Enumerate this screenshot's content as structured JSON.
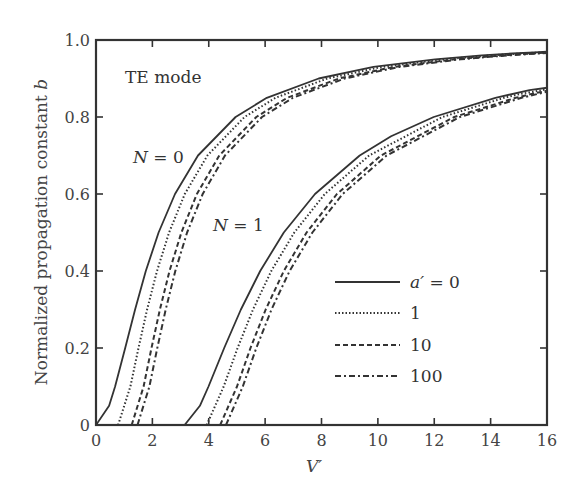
{
  "chart_data": {
    "type": "line",
    "title": "",
    "xlabel": "V′",
    "ylabel": "Normalized propagation constant b",
    "ylabel_plain": "Normalized propagation constant ",
    "ylabel_var": "b",
    "xlim": [
      0,
      16
    ],
    "ylim": [
      0,
      1.0
    ],
    "xticks": [
      0,
      2,
      4,
      6,
      8,
      10,
      12,
      14,
      16
    ],
    "xtick_labels": [
      "0",
      "2",
      "4",
      "6",
      "8",
      "10",
      "12",
      "14",
      "16"
    ],
    "yticks": [
      0,
      0.2,
      0.4,
      0.6,
      0.8,
      1.0
    ],
    "ytick_labels": [
      "0",
      "0.2",
      "0.4",
      "0.6",
      "0.8",
      "1.0"
    ],
    "grid": false,
    "legend_position": "lower right (inside)",
    "annotations": [
      {
        "text": "TE mode",
        "x": 0.5,
        "y": 0.92
      },
      {
        "text": "N = 0",
        "x": 1.5,
        "y": 0.69
      },
      {
        "text": "N = 1",
        "x": 4.3,
        "y": 0.52
      }
    ],
    "legend": [
      {
        "label": "a′ = 0",
        "style": "solid"
      },
      {
        "label": "1",
        "style": "dotted"
      },
      {
        "label": "10",
        "style": "dashed"
      },
      {
        "label": "100",
        "style": "dashdot"
      }
    ],
    "series": [
      {
        "name": "N=0, a'=0",
        "mode": 0,
        "a": 0,
        "style": "solid",
        "V": [
          0,
          0.463,
          0.678,
          1.037,
          1.386,
          1.768,
          2.221,
          2.802,
          3.619,
          4.951,
          6.058,
          7.899,
          9.846,
          12.03,
          13.69,
          14.77,
          15.55,
          16.13
        ],
        "b": [
          0,
          0.05,
          0.1,
          0.2,
          0.3,
          0.4,
          0.5,
          0.6,
          0.7,
          0.8,
          0.85,
          0.9,
          0.93,
          0.95,
          0.96,
          0.965,
          0.968,
          0.97
        ]
      },
      {
        "name": "N=0, a'=1",
        "mode": 0,
        "a": 1,
        "style": "dotted",
        "V": [
          0.785,
          1.22,
          1.509,
          1.814,
          2.164,
          2.592,
          3.151,
          3.952,
          5.268,
          6.368,
          8.204,
          10.15,
          12.33,
          13.99,
          15.07,
          15.58,
          16.2
        ],
        "b": [
          0,
          0.1,
          0.2,
          0.3,
          0.4,
          0.5,
          0.6,
          0.7,
          0.8,
          0.85,
          0.9,
          0.93,
          0.95,
          0.96,
          0.965,
          0.967,
          0.969
        ]
      },
      {
        "name": "N=0, a'=10",
        "mode": 0,
        "a": 10,
        "style": "dashed",
        "V": [
          1.265,
          1.69,
          1.969,
          2.266,
          2.607,
          3.028,
          3.581,
          4.375,
          5.686,
          6.783,
          8.615,
          10.56,
          12.74,
          14.4,
          15.48,
          16.2
        ],
        "b": [
          0,
          0.1,
          0.2,
          0.3,
          0.4,
          0.5,
          0.6,
          0.7,
          0.8,
          0.85,
          0.9,
          0.93,
          0.95,
          0.96,
          0.965,
          0.968
        ]
      },
      {
        "name": "N=0, a'=100",
        "mode": 0,
        "a": 100,
        "style": "dashdot",
        "V": [
          1.471,
          1.895,
          2.175,
          2.471,
          2.812,
          3.233,
          3.785,
          4.578,
          5.889,
          6.985,
          8.818,
          10.76,
          12.94,
          14.6,
          15.68,
          16.2
        ],
        "b": [
          0,
          0.1,
          0.2,
          0.3,
          0.4,
          0.5,
          0.6,
          0.7,
          0.8,
          0.85,
          0.9,
          0.93,
          0.95,
          0.96,
          0.965,
          0.967
        ]
      },
      {
        "name": "N=1, a'=0",
        "mode": 1,
        "a": 0,
        "style": "solid",
        "V": [
          3.142,
          3.686,
          3.99,
          4.549,
          5.14,
          5.824,
          6.664,
          7.769,
          9.355,
          10.47,
          11.98,
          14.17,
          15.38,
          16.2
        ],
        "b": [
          0,
          0.05,
          0.1,
          0.2,
          0.3,
          0.4,
          0.5,
          0.6,
          0.7,
          0.75,
          0.8,
          0.85,
          0.87,
          0.878
        ]
      },
      {
        "name": "N=1, a'=1",
        "mode": 1,
        "a": 1,
        "style": "dotted",
        "V": [
          3.927,
          4.531,
          5.022,
          5.569,
          6.219,
          7.035,
          8.118,
          9.688,
          12.29,
          14.48,
          15.05,
          16.2
        ],
        "b": [
          0,
          0.1,
          0.2,
          0.3,
          0.4,
          0.5,
          0.6,
          0.7,
          0.8,
          0.85,
          0.86,
          0.874
        ]
      },
      {
        "name": "N=1, a'=10",
        "mode": 1,
        "a": 10,
        "style": "dashed",
        "V": [
          4.406,
          5.001,
          5.482,
          6.02,
          6.663,
          7.471,
          8.548,
          10.11,
          12.71,
          14.89,
          15.46,
          16.2
        ],
        "b": [
          0,
          0.1,
          0.2,
          0.3,
          0.4,
          0.5,
          0.6,
          0.7,
          0.8,
          0.85,
          0.86,
          0.871
        ]
      },
      {
        "name": "N=1, a'=100",
        "mode": 1,
        "a": 100,
        "style": "dashdot",
        "V": [
          4.613,
          5.207,
          5.687,
          6.225,
          6.868,
          7.676,
          8.752,
          10.31,
          12.91,
          15.1,
          15.67,
          16.2
        ],
        "b": [
          0,
          0.1,
          0.2,
          0.3,
          0.4,
          0.5,
          0.6,
          0.7,
          0.8,
          0.85,
          0.86,
          0.869
        ]
      }
    ]
  },
  "labels": {
    "mode": "TE mode",
    "n0_prefix": "N",
    "n0_suffix": " = 0",
    "n1_prefix": "N",
    "n1_suffix": " = 1",
    "xlabel": "V′",
    "ylabel_text": "Normalized propagation constant ",
    "ylabel_var": "b",
    "legend_a_var": "a′",
    "legend_a_suffix": " = 0",
    "legend_1": "1",
    "legend_10": "10",
    "legend_100": "100"
  },
  "colors": {
    "line": "#333333",
    "axis": "#333333",
    "text": "#444444"
  }
}
